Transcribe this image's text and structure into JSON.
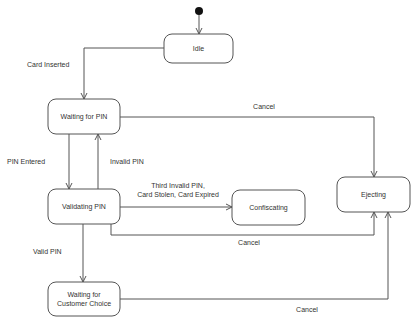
{
  "diagram": {
    "type": "uml-state-machine",
    "initial": {
      "to": "idle"
    },
    "states": [
      {
        "id": "idle",
        "label": [
          "Idle"
        ]
      },
      {
        "id": "waiting_pin",
        "label": [
          "Waiting for PIN"
        ]
      },
      {
        "id": "validating",
        "label": [
          "Validating PIN"
        ]
      },
      {
        "id": "confiscating",
        "label": [
          "Confiscating"
        ]
      },
      {
        "id": "ejecting",
        "label": [
          "Ejecting"
        ]
      },
      {
        "id": "customer_choice",
        "label": [
          "Waiting for",
          "Customer Choice"
        ]
      }
    ],
    "transitions": [
      {
        "id": "t_card_inserted",
        "from": "idle",
        "to": "waiting_pin",
        "label": [
          "Card Inserted"
        ]
      },
      {
        "id": "t_pin_entered",
        "from": "waiting_pin",
        "to": "validating",
        "label": [
          "PIN Entered"
        ]
      },
      {
        "id": "t_invalid_pin",
        "from": "validating",
        "to": "waiting_pin",
        "label": [
          "Invalid PIN"
        ]
      },
      {
        "id": "t_confiscate",
        "from": "validating",
        "to": "confiscating",
        "label": [
          "Third Invalid PIN,",
          "Card Stolen, Card Expired"
        ]
      },
      {
        "id": "t_cancel_1",
        "from": "waiting_pin",
        "to": "ejecting",
        "label": [
          "Cancel"
        ]
      },
      {
        "id": "t_cancel_2",
        "from": "validating",
        "to": "ejecting",
        "label": [
          "Cancel"
        ]
      },
      {
        "id": "t_valid_pin",
        "from": "validating",
        "to": "customer_choice",
        "label": [
          "Valid PIN"
        ]
      },
      {
        "id": "t_cancel_3",
        "from": "customer_choice",
        "to": "ejecting",
        "label": [
          "Cancel"
        ]
      }
    ]
  },
  "colors": {
    "line": "#555555",
    "text": "#333333",
    "initial": "#111111"
  }
}
